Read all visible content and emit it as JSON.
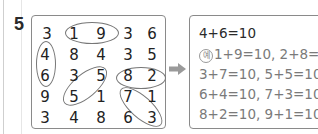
{
  "question_number": "5",
  "grid": {
    "rows": [
      [
        "3",
        "1",
        "9",
        "3",
        "6"
      ],
      [
        "4",
        "8",
        "4",
        "3",
        "5"
      ],
      [
        "6",
        "3",
        "5",
        "8",
        "2"
      ],
      [
        "9",
        "5",
        "1",
        "7",
        "1"
      ],
      [
        "3",
        "4",
        "8",
        "6",
        "3"
      ]
    ],
    "circled_pairs": [
      {
        "cells": [
          [
            0,
            1
          ],
          [
            0,
            2
          ]
        ],
        "sum": "1+9"
      },
      {
        "cells": [
          [
            1,
            0
          ],
          [
            2,
            0
          ]
        ],
        "sum": "4+6"
      },
      {
        "cells": [
          [
            2,
            2
          ],
          [
            3,
            1
          ]
        ],
        "sum": "5+5"
      },
      {
        "cells": [
          [
            2,
            3
          ],
          [
            2,
            4
          ]
        ],
        "sum": "8+2"
      },
      {
        "cells": [
          [
            3,
            3
          ],
          [
            4,
            4
          ]
        ],
        "sum": "7+3"
      }
    ]
  },
  "arrow_icon": "right-arrow",
  "answer": {
    "main": "4+6=10",
    "example_marker": "예",
    "lines": [
      "1+9=10, 2+8=10,",
      "3+7=10, 5+5=10,",
      "6+4=10, 7+3=10,",
      "8+2=10, 9+1=10"
    ]
  }
}
